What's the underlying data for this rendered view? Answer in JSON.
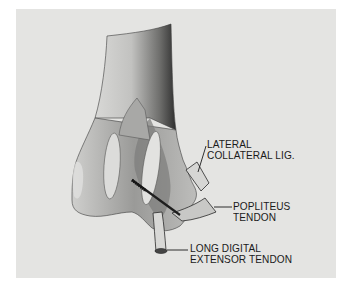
{
  "figure": {
    "background_color": "#e4e4e2",
    "ink_color": "#1a1a1a"
  },
  "labels": [
    {
      "id": "lateral-collateral-lig",
      "line1": "LATERAL",
      "line2": "COLLATERAL LIG."
    },
    {
      "id": "popliteus-tendon",
      "line1": "POPLITEUS",
      "line2": "TENDON"
    },
    {
      "id": "long-digital-extensor-tendon",
      "line1": "LONG DIGITAL",
      "line2": "EXTENSOR TENDON"
    }
  ]
}
